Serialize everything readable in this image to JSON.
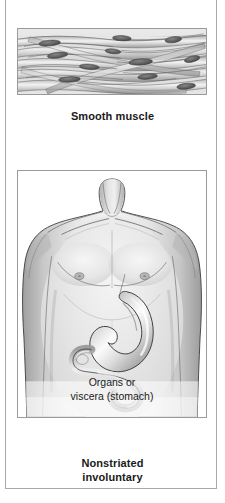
{
  "figure": {
    "background_color": "#ffffff",
    "frame_color": "#a9a9a9",
    "panel_border_color": "#9a9a9a",
    "text_color": "#1a1a1a"
  },
  "panels": {
    "smooth_muscle": {
      "illustration_name": "smooth-muscle-tissue-illustration",
      "description": "Histology drawing of smooth muscle tissue: overlapping elongated spindle-shaped fibers, each with a single dark central oval nucleus",
      "caption": "Smooth muscle"
    },
    "viscera": {
      "illustration_name": "human-torso-with-stomach-illustration",
      "description": "Grayscale shaded drawing of a male human torso, head cropped, showing the stomach and duodenum in the abdomen",
      "caption_line_1": "Organs or",
      "caption_line_2": "viscera (stomach)"
    }
  },
  "bottom_caption": {
    "line_1": "Nonstriated",
    "line_2": "involuntary"
  }
}
